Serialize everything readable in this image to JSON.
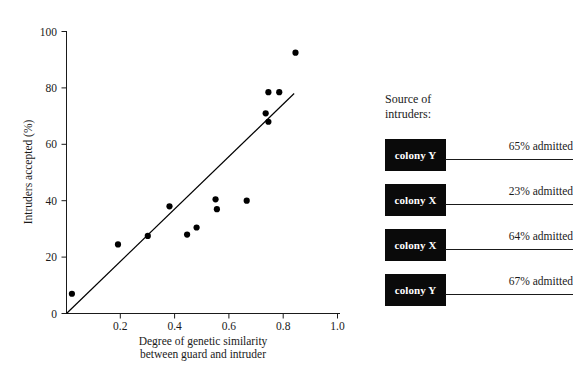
{
  "chart_data": {
    "type": "scatter",
    "title": "",
    "xlabel": "Degree of genetic similarity\nbetween guard and intruder",
    "xlabel_line1": "Degree of genetic similarity",
    "xlabel_line2": "between guard and intruder",
    "ylabel": "Intruders accepted (%)",
    "xlim": [
      0,
      1.0
    ],
    "ylim": [
      0,
      100
    ],
    "xticks": [
      0.2,
      0.4,
      0.6,
      0.8,
      1.0
    ],
    "xtick_labels": [
      "0.2",
      "0.4",
      "0.6",
      "0.8",
      "1.0"
    ],
    "yticks": [
      0,
      20,
      40,
      60,
      80,
      100
    ],
    "ytick_labels": [
      "0",
      "20",
      "40",
      "60",
      "80",
      "100"
    ],
    "grid": false,
    "legend": false,
    "marker": "filled-circle",
    "marker_color": "#000000",
    "points": [
      {
        "x": 0.02,
        "y": 7.0
      },
      {
        "x": 0.19,
        "y": 24.5
      },
      {
        "x": 0.3,
        "y": 27.5
      },
      {
        "x": 0.38,
        "y": 38.0
      },
      {
        "x": 0.445,
        "y": 28.0
      },
      {
        "x": 0.48,
        "y": 30.5
      },
      {
        "x": 0.55,
        "y": 40.5
      },
      {
        "x": 0.555,
        "y": 37.0
      },
      {
        "x": 0.665,
        "y": 40.0
      },
      {
        "x": 0.735,
        "y": 71.0
      },
      {
        "x": 0.745,
        "y": 78.5
      },
      {
        "x": 0.745,
        "y": 68.0
      },
      {
        "x": 0.785,
        "y": 78.5
      },
      {
        "x": 0.845,
        "y": 92.5
      }
    ],
    "trend_line": {
      "type": "linear-fit",
      "x_start": 0.0,
      "y_start": 0.0,
      "x_end": 0.84,
      "y_end": 78.0,
      "color": "#000000"
    }
  },
  "source_panel": {
    "heading": "Source of\nintruders:",
    "rows": [
      {
        "colony": "colony Y",
        "admitted": "65% admitted"
      },
      {
        "colony": "colony X",
        "admitted": "23% admitted"
      },
      {
        "colony": "colony X",
        "admitted": "64% admitted"
      },
      {
        "colony": "colony Y",
        "admitted": "67% admitted"
      }
    ],
    "box_color": "#0a0a0a",
    "box_text_color": "#ffffff"
  }
}
